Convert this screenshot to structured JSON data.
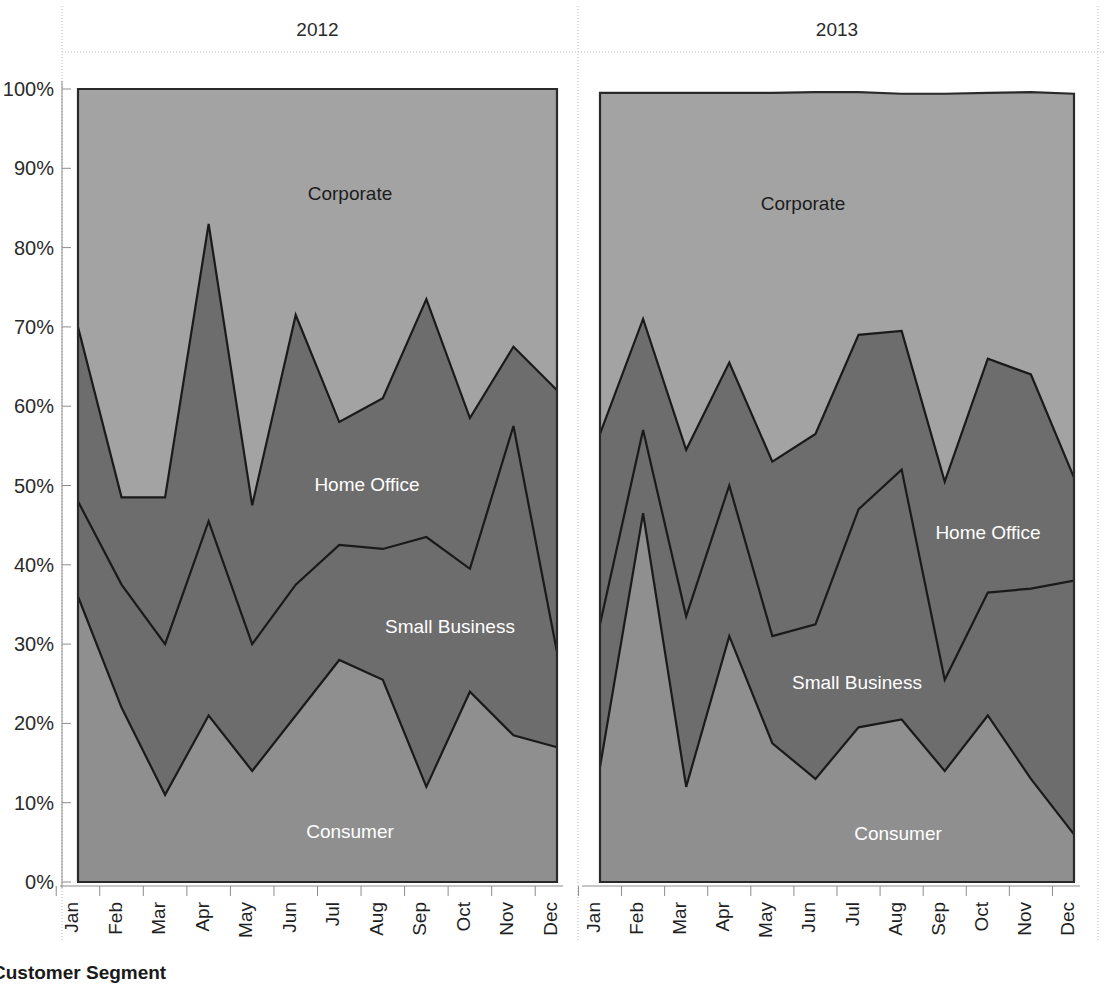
{
  "footer": {
    "title": "Customer Segment"
  },
  "axes": {
    "y": {
      "ticks": [
        "0%",
        "10%",
        "20%",
        "30%",
        "40%",
        "50%",
        "60%",
        "70%",
        "80%",
        "90%",
        "100%"
      ],
      "min": 0,
      "max": 100,
      "label": ""
    },
    "x": {
      "label": "",
      "categories": [
        "Jan",
        "Feb",
        "Mar",
        "Apr",
        "May",
        "Jun",
        "Jul",
        "Aug",
        "Sep",
        "Oct",
        "Nov",
        "Dec"
      ]
    }
  },
  "panels": [
    {
      "header": "2012"
    },
    {
      "header": "2013"
    }
  ],
  "series_labels": {
    "corporate": "Corporate",
    "home_office": "Home Office",
    "small_business": "Small Business",
    "consumer": "Consumer"
  },
  "colors": {
    "corporate": "#a3a3a3",
    "home_office": "#6d6d6d",
    "small_business": "#6d6d6d",
    "consumer": "#8f8f8f",
    "outline": "#1a1a1a",
    "grid": "#b9b9b9",
    "axis": "#8d8d8d",
    "text_dark": "#1c1c1c",
    "text_light": "#ffffff",
    "background": "#ffffff"
  },
  "chart_data": {
    "type": "area",
    "stacked": true,
    "normalized_percent": true,
    "title": "",
    "subtitle": "",
    "xlabel": "",
    "ylabel": "",
    "ylim": [
      0,
      100
    ],
    "grid": false,
    "legend": "inline-labels",
    "categories": [
      "Jan",
      "Feb",
      "Mar",
      "Apr",
      "May",
      "Jun",
      "Jul",
      "Aug",
      "Sep",
      "Oct",
      "Nov",
      "Dec"
    ],
    "panels": [
      {
        "name": "2012",
        "series": [
          {
            "name": "Consumer",
            "values": [
              36,
              22,
              11,
              21,
              14,
              21,
              28,
              25.5,
              12,
              24,
              18.5,
              17
            ]
          },
          {
            "name": "Small Business",
            "values": [
              12,
              15.5,
              19,
              24.5,
              16,
              16.5,
              14.5,
              16.5,
              31.5,
              15.5,
              39,
              12
            ]
          },
          {
            "name": "Home Office",
            "values": [
              22,
              11,
              18.5,
              37.5,
              17.5,
              34,
              15.5,
              19,
              30,
              19,
              10,
              33
            ]
          },
          {
            "name": "Corporate",
            "values": [
              30,
              51.5,
              51.5,
              17,
              52.5,
              28.5,
              42,
              39,
              26.5,
              41.5,
              32.5,
              38
            ]
          }
        ],
        "cumulative_boundaries": {
          "consumer_top": [
            36,
            22,
            11,
            21,
            14,
            21,
            28,
            25.5,
            12,
            24,
            18.5,
            17
          ],
          "small_business_top": [
            48,
            37.5,
            30,
            45.5,
            30,
            37.5,
            42.5,
            42,
            43.5,
            39.5,
            57.5,
            29
          ],
          "home_office_top": [
            70,
            48.5,
            48.5,
            83,
            47.5,
            71.5,
            58,
            61,
            73.5,
            58.5,
            67.5,
            62
          ],
          "corporate_top": [
            100,
            100,
            100,
            100,
            100,
            100,
            100,
            100,
            100,
            100,
            100,
            100
          ]
        }
      },
      {
        "name": "2013",
        "series": [
          {
            "name": "Consumer",
            "values": [
              14.5,
              46.5,
              12,
              31,
              17.5,
              13,
              19.5,
              20.5,
              14,
              21,
              13,
              6
            ]
          },
          {
            "name": "Small Business",
            "values": [
              18,
              10.5,
              21.5,
              19,
              13.5,
              19.5,
              27.5,
              31.5,
              11.5,
              15.5,
              24,
              32
            ]
          },
          {
            "name": "Home Office",
            "values": [
              24,
              14,
              21,
              15.5,
              22,
              24,
              22,
              17.5,
              25,
              29.5,
              27,
              13
            ]
          },
          {
            "name": "Corporate",
            "values": [
              43,
              28.5,
              45,
              34,
              46.5,
              43.1,
              30.6,
              29.9,
              48.9,
              33.5,
              35.6,
              48.4
            ]
          }
        ],
        "cumulative_boundaries": {
          "consumer_top": [
            14.5,
            46.5,
            12,
            31,
            17.5,
            13,
            19.5,
            20.5,
            14,
            21,
            13,
            6
          ],
          "small_business_top": [
            32.5,
            57,
            33.5,
            50,
            31,
            32.5,
            47,
            52,
            25.5,
            36.5,
            37,
            38
          ],
          "home_office_top": [
            56.5,
            71,
            54.5,
            65.5,
            53,
            56.5,
            69,
            69.5,
            50.5,
            66,
            64,
            51
          ],
          "corporate_top": [
            99.5,
            99.5,
            99.5,
            99.5,
            99.5,
            99.6,
            99.6,
            99.4,
            99.4,
            99.5,
            99.6,
            99.4
          ]
        }
      }
    ],
    "annotations": [
      {
        "text": "Corporate",
        "panel": "2012",
        "x_approx": "Jun",
        "y_approx": 86
      },
      {
        "text": "Home Office",
        "panel": "2012",
        "x_approx": "Jul",
        "y_approx": 52
      },
      {
        "text": "Small Business",
        "panel": "2012",
        "x_approx": "Aug",
        "y_approx": 35
      },
      {
        "text": "Consumer",
        "panel": "2012",
        "x_approx": "Jun",
        "y_approx": 9
      },
      {
        "text": "Corporate",
        "panel": "2013",
        "x_approx": "May",
        "y_approx": 85
      },
      {
        "text": "Home Office",
        "panel": "2013",
        "x_approx": "Oct",
        "y_approx": 44
      },
      {
        "text": "Small Business",
        "panel": "2013",
        "x_approx": "Jul",
        "y_approx": 27
      },
      {
        "text": "Consumer",
        "panel": "2013",
        "x_approx": "Aug",
        "y_approx": 9
      }
    ]
  }
}
